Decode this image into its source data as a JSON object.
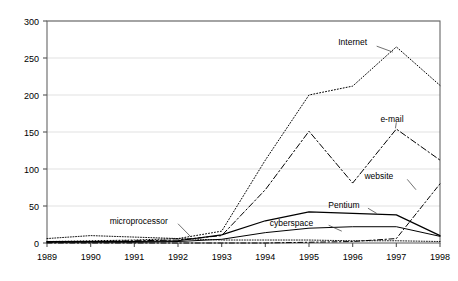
{
  "chart_data": {
    "type": "line",
    "title": "",
    "subtitle": "",
    "xlabel": "",
    "ylabel": "",
    "x": [
      1989,
      1990,
      1991,
      1992,
      1993,
      1994,
      1995,
      1996,
      1997,
      1998
    ],
    "categories": [
      "1989",
      "1990",
      "1991",
      "1992",
      "1993",
      "1994",
      "1995",
      "1996",
      "1997",
      "1998"
    ],
    "xlim": [
      1989,
      1998
    ],
    "ylim": [
      0,
      300
    ],
    "yticks": [
      0,
      50,
      100,
      150,
      200,
      250,
      300
    ],
    "ytick_labels": [
      "0",
      "50",
      "100",
      "150",
      "200",
      "250",
      "300"
    ],
    "grid": true,
    "legend": "inline-labels",
    "series": [
      {
        "name": "Internet",
        "label": "Internet",
        "style": "dotted",
        "values": [
          2,
          3,
          4,
          6,
          16,
          112,
          200,
          212,
          265,
          213
        ]
      },
      {
        "name": "e-mail",
        "label": "e-mail",
        "style": "dash-dot",
        "values": [
          1,
          2,
          3,
          4,
          10,
          72,
          151,
          81,
          154,
          112
        ]
      },
      {
        "name": "website",
        "label": "website",
        "style": "dash-dot-fine",
        "values": [
          0,
          0,
          0,
          0,
          0,
          0,
          1,
          2,
          6,
          80
        ]
      },
      {
        "name": "Pentium",
        "label": "Pentium",
        "style": "solid",
        "values": [
          2,
          2,
          2,
          3,
          11,
          30,
          42,
          40,
          38,
          10
        ]
      },
      {
        "name": "cyberspace",
        "label": "cyberspace",
        "style": "solid-thin",
        "values": [
          1,
          1,
          1,
          2,
          5,
          14,
          20,
          22,
          22,
          9
        ]
      },
      {
        "name": "microprocessor",
        "label": "microprocessor",
        "style": "dotted-thin",
        "values": [
          6,
          10,
          8,
          6,
          4,
          4,
          4,
          3,
          3,
          2
        ]
      }
    ],
    "annotations": [
      {
        "text": "Internet",
        "x": 1996.0,
        "y": 272
      },
      {
        "text": "e-mail",
        "x": 1996.9,
        "y": 168
      },
      {
        "text": "website",
        "x": 1996.6,
        "y": 90
      },
      {
        "text": "Pentium",
        "x": 1995.8,
        "y": 52
      },
      {
        "text": "cyberspace",
        "x": 1994.6,
        "y": 27
      },
      {
        "text": "microprocessor",
        "x": 1991.1,
        "y": 30
      }
    ]
  }
}
